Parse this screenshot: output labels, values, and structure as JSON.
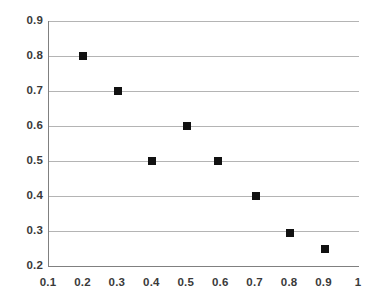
{
  "chart_data": {
    "type": "scatter",
    "title": "",
    "xlabel": "",
    "ylabel": "",
    "xlim": [
      0.1,
      1.0
    ],
    "ylim": [
      0.2,
      0.9
    ],
    "grid": "horizontal",
    "legend": "none",
    "marker_style": "filled-square",
    "marker_color": "#111111",
    "gridline_color": "#b4b4b4",
    "axis_color": "#808080",
    "label_color": "#3a3a3a",
    "background_color": "#ffffff",
    "x_ticks": [
      0.1,
      0.2,
      0.3,
      0.4,
      0.5,
      0.6,
      0.7,
      0.8,
      0.9,
      1.0
    ],
    "x_tick_labels": [
      "0.1",
      "0.2",
      "0.3",
      "0.4",
      "0.5",
      "0.6",
      "0.7",
      "0.8",
      "0.9",
      "1"
    ],
    "y_ticks": [
      0.2,
      0.3,
      0.4,
      0.5,
      0.6,
      0.7,
      0.8,
      0.9
    ],
    "y_tick_labels": [
      "0.2",
      "0.3",
      "0.4",
      "0.5",
      "0.6",
      "0.7",
      "0.8",
      "0.9"
    ],
    "gridline_values": [
      0.3,
      0.4,
      0.5,
      0.6,
      0.7,
      0.8,
      0.9
    ],
    "series": [
      {
        "name": "series-1",
        "points": [
          {
            "x": 0.2,
            "y": 0.8
          },
          {
            "x": 0.3,
            "y": 0.7
          },
          {
            "x": 0.4,
            "y": 0.5
          },
          {
            "x": 0.5,
            "y": 0.6
          },
          {
            "x": 0.59,
            "y": 0.5
          },
          {
            "x": 0.7,
            "y": 0.4
          },
          {
            "x": 0.8,
            "y": 0.295
          },
          {
            "x": 0.9,
            "y": 0.25
          }
        ]
      }
    ]
  }
}
